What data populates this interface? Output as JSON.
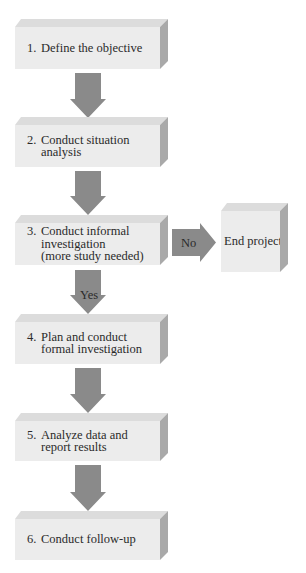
{
  "diagram": {
    "type": "flowchart",
    "steps": [
      {
        "number": "1.",
        "text": "Define the objective"
      },
      {
        "number": "2.",
        "text": "Conduct situation\nanalysis"
      },
      {
        "number": "3.",
        "text": "Conduct informal\ninvestigation\n(more study needed)"
      },
      {
        "number": "4.",
        "text": "Plan and conduct\nformal investigation"
      },
      {
        "number": "5.",
        "text": "Analyze data and\nreport results"
      },
      {
        "number": "6.",
        "text": "Conduct follow-up"
      }
    ],
    "branch": {
      "no_label": "No",
      "yes_label": "Yes",
      "end_box": "End project"
    },
    "colors": {
      "box_face": "#ececec",
      "box_top": "#dcdcdc",
      "box_side": "#a9a9a9",
      "arrow": "#8a8a8a"
    }
  }
}
